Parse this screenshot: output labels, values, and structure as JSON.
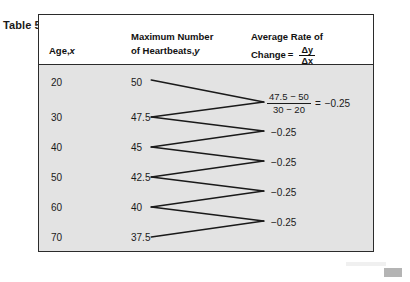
{
  "caption": "Table 5",
  "table": {
    "columns": [
      {
        "key": "age",
        "line1": "",
        "line2_prefix": "Age, ",
        "line2_italic": "x"
      },
      {
        "key": "beats",
        "line1": "Maximum Number",
        "line2_prefix": "of Heartbeats, ",
        "line2_italic": "y"
      },
      {
        "key": "rate",
        "line1": "Average Rate of",
        "line2_prefix": "Change ",
        "equals": "=",
        "frac_num": "Δy",
        "frac_den": "Δx"
      }
    ],
    "rows": [
      {
        "age": "20",
        "beats": "50"
      },
      {
        "age": "30",
        "beats": "47.5"
      },
      {
        "age": "40",
        "beats": "45"
      },
      {
        "age": "50",
        "beats": "42.5"
      },
      {
        "age": "60",
        "beats": "40"
      },
      {
        "age": "70",
        "beats": "37.5"
      }
    ],
    "rates": [
      {
        "type": "fraction",
        "numerator": "47.5 − 50",
        "denominator": "30 − 20",
        "equals": "=",
        "value": "−0.25"
      },
      {
        "type": "value",
        "value": "−0.25"
      },
      {
        "type": "value",
        "value": "−0.25"
      },
      {
        "type": "value",
        "value": "−0.25"
      },
      {
        "type": "value",
        "value": "−0.25"
      }
    ]
  },
  "colors": {
    "body_shade": "#e3e3e3",
    "border": "#2b2b2b",
    "text": "#1a1a1a",
    "connector": "#1a1a1a"
  }
}
